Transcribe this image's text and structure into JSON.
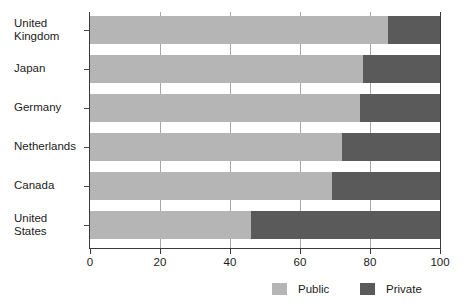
{
  "chart_data": {
    "type": "bar",
    "orientation": "horizontal",
    "stacked": true,
    "normalized": true,
    "title": "",
    "subtitle": "",
    "xlabel": "",
    "ylabel": "",
    "xlim": [
      0,
      100
    ],
    "xticks": [
      0,
      20,
      40,
      60,
      80,
      100
    ],
    "xtick_labels": [
      "0",
      "20",
      "40",
      "60",
      "80",
      "100"
    ],
    "grid": true,
    "grid_axis": "x",
    "legend_position": "bottom-right",
    "categories": [
      "United Kingdom",
      "Japan",
      "Germany",
      "Netherlands",
      "Canada",
      "United States"
    ],
    "category_labels_multiline": [
      "United\nKingdom",
      "Japan",
      "Germany",
      "Netherlands",
      "Canada",
      "United\nStates"
    ],
    "series": [
      {
        "name": "Public",
        "color": "#b5b5b5",
        "values": [
          85,
          78,
          77,
          72,
          69,
          46
        ]
      },
      {
        "name": "Private",
        "color": "#5a5a5a",
        "values": [
          15,
          22,
          23,
          28,
          31,
          54
        ]
      }
    ]
  },
  "legend": {
    "items": [
      {
        "label": "Public",
        "color": "#b5b5b5",
        "swatch": "public-swatch"
      },
      {
        "label": "Private",
        "color": "#5a5a5a",
        "swatch": "private-swatch"
      }
    ]
  },
  "colors": {
    "public": "#b5b5b5",
    "private": "#5a5a5a",
    "axis": "#3a3a3a",
    "grid": "#a8a8a8",
    "text": "#1c1c1c",
    "background": "#ffffff"
  }
}
